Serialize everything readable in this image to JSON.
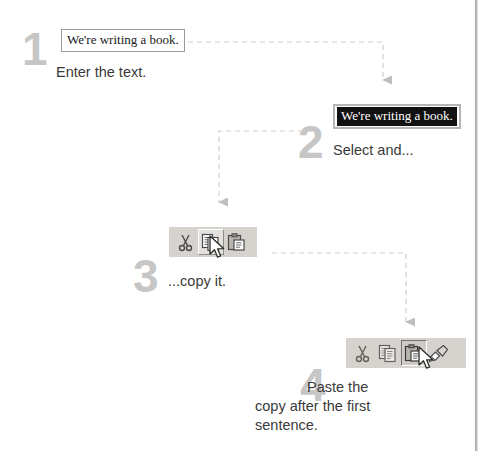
{
  "document": {
    "sentence": "We're writing a book.",
    "selected_sentence": "We're writing a book."
  },
  "steps": [
    {
      "number": "1",
      "caption": "Enter the text.",
      "toolbar_icons": []
    },
    {
      "number": "2",
      "caption": "Select and...",
      "toolbar_icons": []
    },
    {
      "number": "3",
      "caption": "...copy it.",
      "toolbar_icons": [
        "cut-icon",
        "copy-icon",
        "paste-icon"
      ],
      "active_icon": "copy-icon"
    },
    {
      "number": "4",
      "caption": "Paste the\ncopy after the first\nsentence.",
      "toolbar_icons": [
        "cut-icon",
        "copy-icon",
        "paste-icon",
        "format-painter-icon"
      ],
      "active_icon": "paste-icon"
    }
  ],
  "colors": {
    "step_number": "#c6c6c6",
    "caption_text": "#3a3a3a",
    "connector": "#cccccc",
    "toolbar_face": "#d6d3ce",
    "selection_highlight": "#111111",
    "page_edge": "#9e9e9e"
  }
}
